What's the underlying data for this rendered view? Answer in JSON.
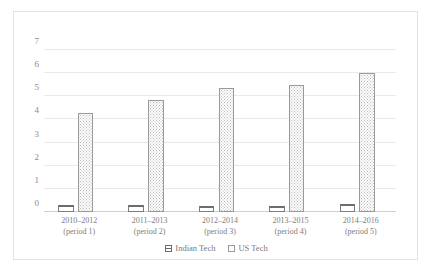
{
  "chart_data": {
    "type": "bar",
    "title": "",
    "subtitle": "",
    "xlabel": "",
    "ylabel": "",
    "ylim": [
      0,
      7
    ],
    "yticks": [
      "0",
      "1",
      "2",
      "3",
      "4",
      "5",
      "6",
      "7"
    ],
    "grid": true,
    "legend_position": "bottom-center",
    "categories": [
      "2010–2012 (period 1)",
      "2011–2013 (period 2)",
      "2012–2014 (period 3)",
      "2013–2015 (period 4)",
      "2014–2016 (period 5)"
    ],
    "category_lines": [
      {
        "line1": "2010–2012",
        "line2": "(period 1)"
      },
      {
        "line1": "2011–2013",
        "line2": "(period 2)"
      },
      {
        "line1": "2012–2014",
        "line2": "(period 3)"
      },
      {
        "line1": "2013–2015",
        "line2": "(period 4)"
      },
      {
        "line1": "2014–2016",
        "line2": "(period 5)"
      }
    ],
    "series": [
      {
        "name": "Indian Tech",
        "values": [
          0.3,
          0.32,
          0.25,
          0.24,
          0.34
        ],
        "color": "#ffffff",
        "edge_color": "#6d6d6d",
        "pattern": "solid-outline"
      },
      {
        "name": "US Tech",
        "values": [
          4.3,
          4.85,
          5.35,
          5.5,
          6.0
        ],
        "color": "#fdfdfd",
        "edge_color": "#9a9a9a",
        "pattern": "dotted"
      }
    ]
  },
  "legend": {
    "items": [
      {
        "label": "Indian Tech"
      },
      {
        "label": "US Tech"
      }
    ]
  },
  "colors": {
    "frame_border": "#e2e2e2",
    "gridline": "#e9e9e9",
    "axis_text": "#8a8a8a",
    "label_text": "#7d7d7d"
  }
}
